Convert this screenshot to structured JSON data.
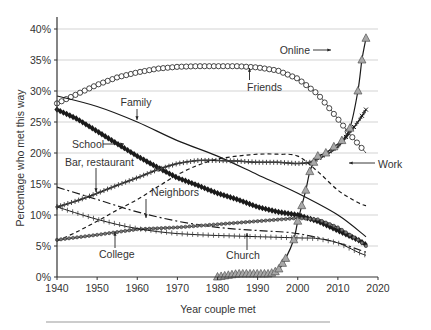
{
  "chart_data": {
    "type": "line",
    "title": "",
    "xlabel": "Year couple met",
    "ylabel": "Percentage who met this way",
    "xlim": [
      1940,
      2020
    ],
    "ylim": [
      0,
      40
    ],
    "x_ticks": [
      "1940",
      "1950",
      "1960",
      "1970",
      "1980",
      "1990",
      "2000",
      "2010",
      "2020"
    ],
    "y_ticks": [
      "0%",
      "5%",
      "10%",
      "15%",
      "20%",
      "25%",
      "30%",
      "35%",
      "40%"
    ],
    "grid": "horizontal",
    "legend": "inline annotations",
    "series": [
      {
        "name": "Friends",
        "marker": "open-circle",
        "x": [
          1940,
          1945,
          1950,
          1955,
          1960,
          1965,
          1970,
          1975,
          1980,
          1985,
          1990,
          1995,
          2000,
          2005,
          2010,
          2013,
          2015,
          2017
        ],
        "values": [
          28,
          29.5,
          31,
          32.2,
          33,
          33.6,
          33.9,
          34,
          34,
          34,
          33.8,
          33.3,
          32,
          29.5,
          25.5,
          23,
          21.5,
          20
        ]
      },
      {
        "name": "Family",
        "marker": "none",
        "x": [
          1940,
          1950,
          1960,
          1970,
          1980,
          1990,
          2000,
          2010,
          2017
        ],
        "values": [
          29.2,
          27.5,
          25,
          22,
          19.5,
          16.5,
          13.5,
          10,
          6.5
        ]
      },
      {
        "name": "School",
        "marker": "filled-diamond",
        "x": [
          1940,
          1945,
          1950,
          1955,
          1960,
          1965,
          1970,
          1975,
          1980,
          1985,
          1990,
          1995,
          2000,
          2005,
          2010,
          2015,
          2017
        ],
        "values": [
          27,
          25.5,
          23.5,
          21.5,
          19.5,
          17.7,
          16,
          14.8,
          13.5,
          12.5,
          11.3,
          10.5,
          10,
          9,
          7.5,
          6,
          5.2
        ]
      },
      {
        "name": "Bar, restaurant",
        "marker": "plus-thick",
        "x": [
          1940,
          1945,
          1950,
          1955,
          1960,
          1965,
          1970,
          1975,
          1980,
          1985,
          1990,
          1995,
          2000,
          2003,
          2005,
          2010,
          2015,
          2017
        ],
        "values": [
          11.3,
          12.3,
          13.5,
          14.8,
          16,
          17.3,
          18.3,
          18.8,
          18.8,
          18.7,
          18.5,
          18.5,
          18.3,
          18.5,
          19,
          21,
          25,
          27
        ]
      },
      {
        "name": "Work",
        "marker": "dashed",
        "x": [
          1940,
          1945,
          1950,
          1955,
          1960,
          1965,
          1970,
          1975,
          1980,
          1985,
          1990,
          1995,
          2000,
          2005,
          2010,
          2015,
          2017
        ],
        "values": [
          5.8,
          7.3,
          9,
          10.8,
          12.5,
          14.5,
          16.5,
          18,
          19,
          19.5,
          19.8,
          19.8,
          19.5,
          17,
          14,
          12,
          11.5
        ]
      },
      {
        "name": "Neighbors",
        "marker": "dash-dot",
        "x": [
          1940,
          1950,
          1960,
          1970,
          1980,
          1990,
          2000,
          2010,
          2017
        ],
        "values": [
          14.5,
          12.5,
          10.5,
          9,
          8,
          7.5,
          7,
          5.5,
          4
        ]
      },
      {
        "name": "College",
        "marker": "small-circle",
        "x": [
          1940,
          1950,
          1960,
          1970,
          1980,
          1990,
          2000,
          2005,
          2010,
          2015,
          2017
        ],
        "values": [
          6,
          6.8,
          7.7,
          8,
          8.5,
          9,
          9.5,
          9.3,
          8,
          6,
          5
        ]
      },
      {
        "name": "Church",
        "marker": "plus-thin",
        "x": [
          1940,
          1950,
          1960,
          1970,
          1980,
          1990,
          2000,
          2005,
          2010,
          2015,
          2017
        ],
        "values": [
          11.3,
          9.3,
          7.8,
          7,
          6.7,
          6.5,
          6.3,
          6.2,
          5.5,
          4,
          3.5
        ]
      },
      {
        "name": "Online",
        "marker": "filled-triangle",
        "x": [
          1980,
          1985,
          1990,
          1993,
          1995,
          1997,
          1999,
          2000,
          2001,
          2002,
          2003,
          2004,
          2005,
          2007,
          2009,
          2011,
          2013,
          2015,
          2016,
          2017
        ],
        "values": [
          0,
          0.5,
          0.5,
          0.5,
          1,
          3,
          6,
          9,
          11.5,
          14,
          17,
          18.5,
          19.5,
          20,
          21,
          22,
          24,
          30,
          35,
          38.5
        ]
      }
    ],
    "annotations": [
      {
        "label": "Friends",
        "target_year": 1983,
        "target_value": 34
      },
      {
        "label": "Family",
        "target_year": 1965,
        "target_value": 23.5
      },
      {
        "label": "School",
        "target_year": 1957,
        "target_value": 20.5
      },
      {
        "label": "Bar, restaurant",
        "target_year": 1949,
        "target_value": 13.3
      },
      {
        "label": "Neighbors",
        "target_year": 1973,
        "target_value": 8.5
      },
      {
        "label": "College",
        "target_year": 1953,
        "target_value": 7.2
      },
      {
        "label": "Church",
        "target_year": 1997,
        "target_value": 6.3
      },
      {
        "label": "Work",
        "target_year": 2009,
        "target_value": 14.5
      },
      {
        "label": "Online",
        "target_year": 2016,
        "target_value": 35
      }
    ]
  },
  "labels": {
    "xlabel": "Year couple met",
    "ylabel": "Percentage who met this way",
    "friends": "Friends",
    "family": "Family",
    "school": "School",
    "bar": "Bar, restaurant",
    "neighbors": "Neighbors",
    "college": "College",
    "church": "Church",
    "work": "Work",
    "online": "Online",
    "x_ticks": [
      "1940",
      "1950",
      "1960",
      "1970",
      "1980",
      "1990",
      "2000",
      "2010",
      "2020"
    ],
    "y_ticks": [
      "0%",
      "5%",
      "10%",
      "15%",
      "20%",
      "25%",
      "30%",
      "35%",
      "40%"
    ]
  },
  "colors": {
    "line": "#1a1a1a",
    "grid": "#c8c8c8",
    "triangle_fill": "#a8a8a8",
    "text": "#333333"
  }
}
